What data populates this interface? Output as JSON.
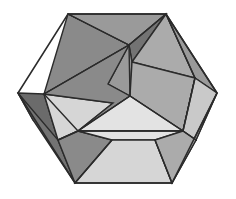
{
  "figure": {
    "background_color": "#ffffff",
    "edge_color": "#2b2b2b",
    "edge_width": 1.4,
    "canvas": {
      "width": 236,
      "height": 199
    }
  },
  "palette": {
    "darkest": "#6b6b6b",
    "dark": "#737373",
    "medium_dark": "#8a8a8a",
    "medium": "#9a9a9a",
    "light_medium": "#ababab",
    "light": "#c9c9c9",
    "lighter": "#d6d6d6",
    "lightest": "#e3e3e3"
  },
  "vertices": {
    "hex_top_left": [
      68,
      14
    ],
    "hex_top_right": [
      166,
      14
    ],
    "hex_right": [
      217,
      93
    ],
    "hex_bottom_right": [
      172,
      183
    ],
    "hex_bottom_left": [
      75,
      183
    ],
    "hex_left": [
      18,
      93
    ],
    "center": [
      130,
      96
    ],
    "upper_node": [
      129,
      45
    ],
    "left_node": [
      78,
      131
    ],
    "right_node": [
      183,
      131
    ],
    "left_mid": [
      44,
      94
    ],
    "right_upper": [
      195,
      78
    ],
    "left_lower_edge": [
      58,
      140
    ],
    "right_lower_edge": [
      196,
      140
    ]
  },
  "facets": [
    {
      "name": "upper-left-large-triangle",
      "color": "#8a8a8a",
      "points": "68,14 129,45 44,94"
    },
    {
      "name": "upper-left-wedge",
      "color": "#9a9a9a",
      "points": "68,14 166,14 129,45"
    },
    {
      "name": "top-dark-triangle",
      "color": "#737373",
      "points": "129,45 166,14 132,62"
    },
    {
      "name": "upper-right-facet",
      "color": "#ababab",
      "points": "166,14 195,78 132,62"
    },
    {
      "name": "right-upper-edge-facet",
      "color": "#9a9a9a",
      "points": "166,14 217,93 195,78"
    },
    {
      "name": "left-edge-dark-facet",
      "color": "#6b6b6b",
      "points": "18,93 44,94 58,140 33,120"
    },
    {
      "name": "left-light-quad",
      "color": "#d6d6d6",
      "points": "44,94 113,103 78,131 58,140"
    },
    {
      "name": "left-lower-dark-triangle",
      "color": "#737373",
      "points": "18,93 33,120 75,183 58,140"
    },
    {
      "name": "center-arm-upper",
      "color": "#9a9a9a",
      "points": "129,45 132,62 130,96 108,84"
    },
    {
      "name": "center-arm-left",
      "color": "#8a8a8a",
      "points": "129,45 108,84 130,96 78,131 113,103 44,94"
    },
    {
      "name": "center-arm-right",
      "color": "#ababab",
      "points": "132,62 195,78 183,131 130,96"
    },
    {
      "name": "center-bottom-triangle",
      "color": "#e3e3e3",
      "points": "130,96 183,131 78,131"
    },
    {
      "name": "right-light-quad",
      "color": "#d6d6d6",
      "points": "195,78 196,140 183,131"
    },
    {
      "name": "right-lower-facet",
      "color": "#c9c9c9",
      "points": "195,78 217,93 196,140 183,131"
    },
    {
      "name": "right-edge-lower-facet",
      "color": "#ababab",
      "points": "217,93 172,183 196,140"
    },
    {
      "name": "bottom-left-dark-facet",
      "color": "#8a8a8a",
      "points": "78,131 112,140 75,183 58,140"
    },
    {
      "name": "bottom-center-light-facet",
      "color": "#e3e3e3",
      "points": "78,131 183,131 155,140 112,140"
    },
    {
      "name": "bottom-main-light-facet",
      "color": "#d6d6d6",
      "points": "112,140 155,140 172,183 75,183"
    },
    {
      "name": "bottom-right-facet",
      "color": "#ababab",
      "points": "183,131 196,140 172,183 155,140"
    }
  ],
  "outline": {
    "name": "hexagon-outline",
    "points": "68,14 166,14 217,93 172,183 75,183 18,93"
  },
  "interior_edges": [
    {
      "name": "edge-center-to-left-node",
      "from": [
        130,
        96
      ],
      "to": [
        78,
        131
      ]
    },
    {
      "name": "edge-center-to-right-node",
      "from": [
        130,
        96
      ],
      "to": [
        183,
        131
      ]
    },
    {
      "name": "edge-center-to-upper-node",
      "from": [
        130,
        96
      ],
      "to": [
        129,
        45
      ]
    },
    {
      "name": "edge-upper-node-to-top-left",
      "from": [
        129,
        45
      ],
      "to": [
        68,
        14
      ]
    },
    {
      "name": "edge-upper-node-to-top-right",
      "from": [
        129,
        45
      ],
      "to": [
        166,
        14
      ]
    },
    {
      "name": "edge-upper-node-to-left-mid",
      "from": [
        129,
        45
      ],
      "to": [
        44,
        94
      ]
    },
    {
      "name": "edge-top-right-to-right-upper",
      "from": [
        166,
        14
      ],
      "to": [
        195,
        78
      ]
    },
    {
      "name": "edge-left-mid-to-left-node",
      "from": [
        44,
        94
      ],
      "to": [
        78,
        131
      ]
    },
    {
      "name": "edge-left-node-to-right-node",
      "from": [
        78,
        131
      ],
      "to": [
        183,
        131
      ]
    },
    {
      "name": "edge-right-upper-to-right-node",
      "from": [
        195,
        78
      ],
      "to": [
        183,
        131
      ]
    },
    {
      "name": "edge-left-node-to-lower-left",
      "from": [
        78,
        131
      ],
      "to": [
        58,
        140
      ]
    },
    {
      "name": "edge-right-node-to-lower-right",
      "from": [
        183,
        131
      ],
      "to": [
        196,
        140
      ]
    },
    {
      "name": "edge-bottom-left-diagonal",
      "from": [
        112,
        140
      ],
      "to": [
        75,
        183
      ]
    },
    {
      "name": "edge-bottom-right-diagonal",
      "from": [
        155,
        140
      ],
      "to": [
        172,
        183
      ]
    }
  ]
}
